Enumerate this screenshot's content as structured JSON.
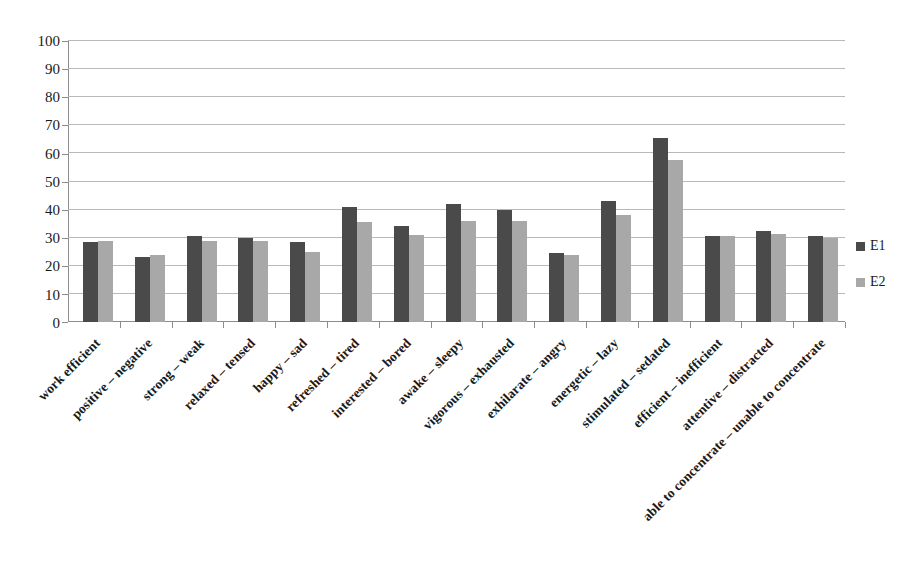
{
  "chart_data": {
    "type": "bar",
    "title": "",
    "subtitle": "",
    "xlabel": "",
    "ylabel": "",
    "ylim": [
      0,
      100
    ],
    "yticks": [
      0,
      10,
      20,
      30,
      40,
      50,
      60,
      70,
      80,
      90,
      100
    ],
    "grid": true,
    "legend_position": "right",
    "categories": [
      "work efficient",
      "positive – negative",
      "strong – weak",
      "relaxed – tensed",
      "happy – sad",
      "refreshed – tired",
      "interested – bored",
      "awake – sleepy",
      "vigorous – exhausted",
      "exhilarate – angry",
      "energetic – lazy",
      "stimulated – sedated",
      "efficient – inefficient",
      "attentive – distracted",
      "able to concentrate – unable to concentrate"
    ],
    "series": [
      {
        "name": "E1",
        "color": "#4a4a4a",
        "values": [
          28.5,
          23,
          30.5,
          30,
          28.5,
          41,
          34,
          42,
          40,
          24.5,
          43,
          65.5,
          30.5,
          32.5,
          30.5
        ]
      },
      {
        "name": "E2",
        "color": "#a8a8a8",
        "values": [
          29,
          24,
          29,
          29,
          25,
          35.5,
          31,
          36,
          36,
          24,
          38,
          57.5,
          30.5,
          31.5,
          30
        ]
      }
    ]
  },
  "legend": {
    "items": [
      {
        "label": "E1",
        "color": "#4a4a4a"
      },
      {
        "label": "E2",
        "color": "#a8a8a8"
      }
    ]
  }
}
